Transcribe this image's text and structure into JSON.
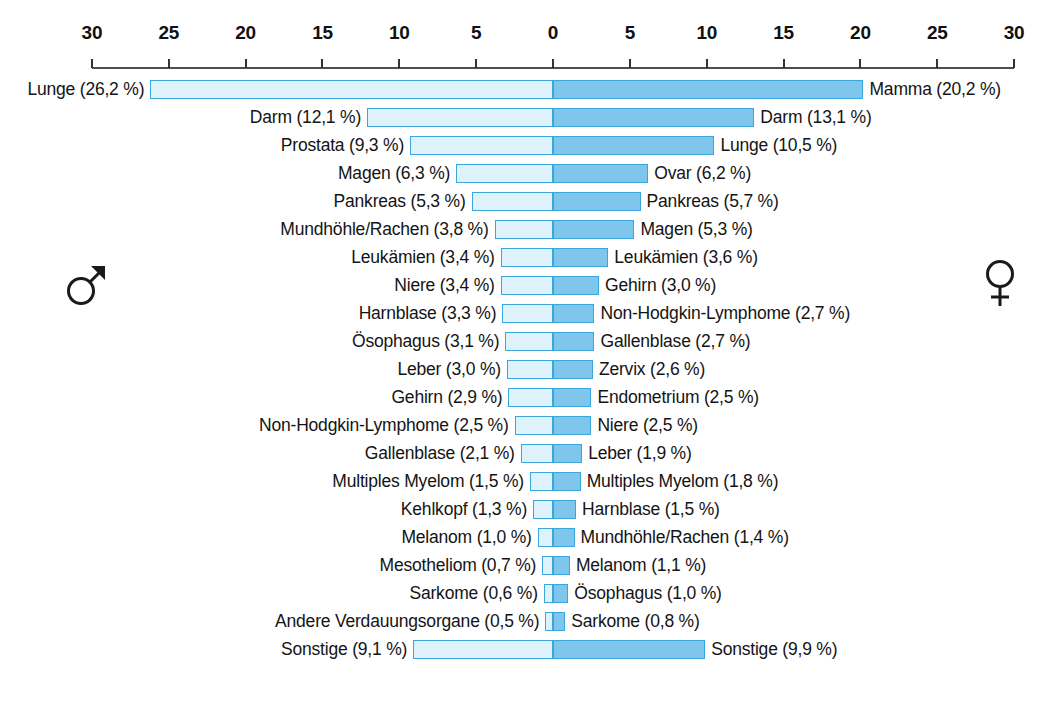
{
  "chart_data": {
    "type": "bar",
    "orientation": "horizontal-diverging",
    "title": "",
    "subtitle": "",
    "xlabel": "",
    "ylabel": "",
    "grid": false,
    "legend_position": "inline-symbols",
    "axis": {
      "left_max": 30,
      "right_max": 30,
      "unit": "%",
      "tick_labels": [
        "30",
        "25",
        "20",
        "15",
        "10",
        "5",
        "0",
        "5",
        "10",
        "15",
        "20",
        "25",
        "30"
      ],
      "tick_values": [
        -30,
        -25,
        -20,
        -15,
        -10,
        -5,
        0,
        5,
        10,
        15,
        20,
        25,
        30
      ]
    },
    "series": [
      {
        "name": "männlich",
        "symbol": "♂",
        "color": "#ddf2fb",
        "border_color": "#3ba6dd",
        "side": "left"
      },
      {
        "name": "weiblich",
        "symbol": "♀",
        "color": "#7fc6ec",
        "border_color": "#3ba6dd",
        "side": "right"
      }
    ],
    "rows": [
      {
        "male_label": "Lunge (26,2 %)",
        "male_value": 26.2,
        "female_label": "Mamma (20,2 %)",
        "female_value": 20.2
      },
      {
        "male_label": "Darm (12,1 %)",
        "male_value": 12.1,
        "female_label": "Darm (13,1 %)",
        "female_value": 13.1
      },
      {
        "male_label": "Prostata (9,3 %)",
        "male_value": 9.3,
        "female_label": "Lunge (10,5 %)",
        "female_value": 10.5
      },
      {
        "male_label": "Magen (6,3 %)",
        "male_value": 6.3,
        "female_label": "Ovar (6,2 %)",
        "female_value": 6.2
      },
      {
        "male_label": "Pankreas (5,3 %)",
        "male_value": 5.3,
        "female_label": "Pankreas (5,7 %)",
        "female_value": 5.7
      },
      {
        "male_label": "Mundhöhle/Rachen (3,8 %)",
        "male_value": 3.8,
        "female_label": "Magen (5,3 %)",
        "female_value": 5.3
      },
      {
        "male_label": "Leukämien (3,4 %)",
        "male_value": 3.4,
        "female_label": "Leukämien (3,6 %)",
        "female_value": 3.6
      },
      {
        "male_label": "Niere (3,4 %)",
        "male_value": 3.4,
        "female_label": "Gehirn (3,0 %)",
        "female_value": 3.0
      },
      {
        "male_label": "Harnblase (3,3 %)",
        "male_value": 3.3,
        "female_label": "Non-Hodgkin-Lymphome (2,7 %)",
        "female_value": 2.7
      },
      {
        "male_label": "Ösophagus (3,1 %)",
        "male_value": 3.1,
        "female_label": "Gallenblase (2,7 %)",
        "female_value": 2.7
      },
      {
        "male_label": "Leber (3,0 %)",
        "male_value": 3.0,
        "female_label": "Zervix (2,6 %)",
        "female_value": 2.6
      },
      {
        "male_label": "Gehirn (2,9 %)",
        "male_value": 2.9,
        "female_label": "Endometrium (2,5 %)",
        "female_value": 2.5
      },
      {
        "male_label": "Non-Hodgkin-Lymphome (2,5 %)",
        "male_value": 2.5,
        "female_label": "Niere (2,5 %)",
        "female_value": 2.5
      },
      {
        "male_label": "Gallenblase (2,1 %)",
        "male_value": 2.1,
        "female_label": "Leber (1,9 %)",
        "female_value": 1.9
      },
      {
        "male_label": "Multiples Myelom (1,5 %)",
        "male_value": 1.5,
        "female_label": "Multiples Myelom (1,8 %)",
        "female_value": 1.8
      },
      {
        "male_label": "Kehlkopf (1,3 %)",
        "male_value": 1.3,
        "female_label": "Harnblase (1,5 %)",
        "female_value": 1.5
      },
      {
        "male_label": "Melanom (1,0 %)",
        "male_value": 1.0,
        "female_label": "Mundhöhle/Rachen (1,4 %)",
        "female_value": 1.4
      },
      {
        "male_label": "Mesotheliom (0,7 %)",
        "male_value": 0.7,
        "female_label": "Melanom (1,1 %)",
        "female_value": 1.1
      },
      {
        "male_label": "Sarkome (0,6 %)",
        "male_value": 0.6,
        "female_label": "Ösophagus (1,0 %)",
        "female_value": 1.0
      },
      {
        "male_label": "Andere Verdauungsorgane (0,5 %)",
        "male_value": 0.5,
        "female_label": "Sarkome (0,8 %)",
        "female_value": 0.8
      },
      {
        "male_label": "Sonstige (9,1 %)",
        "male_value": 9.1,
        "female_label": "Sonstige (9,9 %)",
        "female_value": 9.9
      }
    ]
  },
  "symbols": {
    "male": "male-symbol",
    "female": "female-symbol"
  }
}
